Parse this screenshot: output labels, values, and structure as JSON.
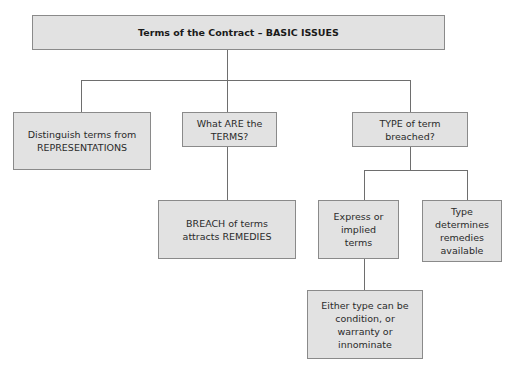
{
  "diagram": {
    "title": "Terms of the Contract – BASIC ISSUES",
    "nodes": {
      "distinguish": "Distinguish terms from\nREPRESENTATIONS",
      "what_are": "What ARE the\nTERMS?",
      "type_breached": "TYPE of term\nbreached?",
      "breach": "BREACH of terms\nattracts REMEDIES",
      "express_implied": "Express or\nimplied\nterms",
      "type_determines": "Type\ndetermines\nremedies\navailable",
      "either_type": "Either type can be\ncondition, or\nwarranty or\ninnominate"
    },
    "edges": [
      [
        "title",
        "distinguish"
      ],
      [
        "title",
        "what_are"
      ],
      [
        "title",
        "type_breached"
      ],
      [
        "what_are",
        "breach"
      ],
      [
        "type_breached",
        "express_implied"
      ],
      [
        "type_breached",
        "type_determines"
      ],
      [
        "express_implied",
        "either_type"
      ]
    ]
  }
}
